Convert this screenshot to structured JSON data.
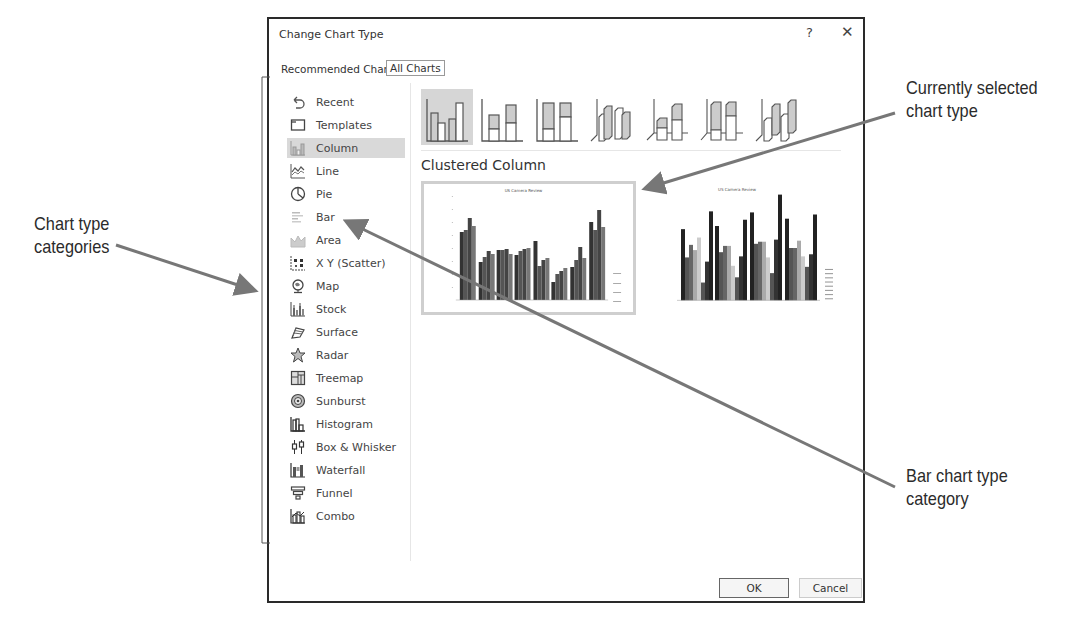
{
  "caption": {
    "text": "Figure: Changing chart type using the Change Chart Type dialog"
  },
  "dialog": {
    "title": "Change Chart Type",
    "help_label": "?",
    "close_label": "✕",
    "tabs": [
      {
        "label": "Recommended Charts",
        "active": false
      },
      {
        "label": "All Charts",
        "active": true
      }
    ],
    "sidebar": {
      "items": [
        {
          "label": "Recent",
          "icon": "recent-icon",
          "selected": false
        },
        {
          "label": "Templates",
          "icon": "templates-icon",
          "selected": false
        },
        {
          "label": "Column",
          "icon": "column-chart-icon",
          "selected": true
        },
        {
          "label": "Line",
          "icon": "line-chart-icon",
          "selected": false
        },
        {
          "label": "Pie",
          "icon": "pie-chart-icon",
          "selected": false
        },
        {
          "label": "Bar",
          "icon": "bar-chart-icon",
          "selected": false
        },
        {
          "label": "Area",
          "icon": "area-chart-icon",
          "selected": false
        },
        {
          "label": "X Y (Scatter)",
          "icon": "scatter-chart-icon",
          "selected": false
        },
        {
          "label": "Map",
          "icon": "map-chart-icon",
          "selected": false
        },
        {
          "label": "Stock",
          "icon": "stock-chart-icon",
          "selected": false
        },
        {
          "label": "Surface",
          "icon": "surface-chart-icon",
          "selected": false
        },
        {
          "label": "Radar",
          "icon": "radar-chart-icon",
          "selected": false
        },
        {
          "label": "Treemap",
          "icon": "treemap-chart-icon",
          "selected": false
        },
        {
          "label": "Sunburst",
          "icon": "sunburst-chart-icon",
          "selected": false
        },
        {
          "label": "Histogram",
          "icon": "histogram-chart-icon",
          "selected": false
        },
        {
          "label": "Box & Whisker",
          "icon": "box-whisker-chart-icon",
          "selected": false
        },
        {
          "label": "Waterfall",
          "icon": "waterfall-chart-icon",
          "selected": false
        },
        {
          "label": "Funnel",
          "icon": "funnel-chart-icon",
          "selected": false
        },
        {
          "label": "Combo",
          "icon": "combo-chart-icon",
          "selected": false
        }
      ]
    },
    "subtypes": [
      {
        "name": "clustered-column",
        "selected": true
      },
      {
        "name": "stacked-column",
        "selected": false
      },
      {
        "name": "100-stacked-column",
        "selected": false
      },
      {
        "name": "3d-clustered-column",
        "selected": false
      },
      {
        "name": "3d-stacked-column",
        "selected": false
      },
      {
        "name": "3d-100-stacked-column",
        "selected": false
      },
      {
        "name": "3d-column",
        "selected": false
      }
    ],
    "selected_subtype_label": "Clustered Column",
    "previews": [
      {
        "title": "US Camera Review",
        "selected": true
      },
      {
        "title": "US Camera Review",
        "selected": false
      }
    ],
    "buttons": {
      "ok": "OK",
      "cancel": "Cancel"
    }
  },
  "annotations": {
    "chart_type_categories": [
      "Chart type",
      "categories"
    ],
    "currently_selected": [
      "Currently selected",
      "chart type"
    ],
    "bar_category": [
      "Bar chart type",
      "category"
    ]
  },
  "colors": {
    "dialog_border": "#2a2a2a",
    "selection_bg": "#d9d9d9",
    "arrow": "#777777"
  }
}
